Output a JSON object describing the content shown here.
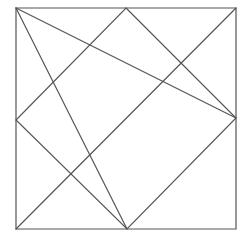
{
  "diagram": {
    "type": "geometric-line-figure",
    "canvas": {
      "width": 248,
      "height": 237
    },
    "stroke_color": "#555555",
    "background_color": "#ffffff",
    "points": {
      "top_left": [
        16,
        8
      ],
      "top_mid": [
        126,
        8
      ],
      "top_right": [
        236,
        8
      ],
      "left_mid": [
        16,
        120
      ],
      "right_mid": [
        236,
        118
      ],
      "bottom_left": [
        16,
        229
      ],
      "bottom_mid": [
        127,
        229
      ],
      "bottom_right": [
        236,
        229
      ]
    },
    "square": {
      "name": "outer-square",
      "points": "16,8 236,8 236,229 16,229"
    },
    "diamond": {
      "name": "inscribed-diamond",
      "points": "126,8 236,118 127,229 16,120"
    },
    "lines": [
      {
        "name": "line-top-left-to-right-mid",
        "x1": 16,
        "y1": 8,
        "x2": 236,
        "y2": 118
      },
      {
        "name": "line-top-left-to-bottom-mid",
        "x1": 16,
        "y1": 8,
        "x2": 127,
        "y2": 229
      },
      {
        "name": "line-top-right-to-bottom-left",
        "x1": 236,
        "y1": 8,
        "x2": 16,
        "y2": 229
      }
    ]
  }
}
